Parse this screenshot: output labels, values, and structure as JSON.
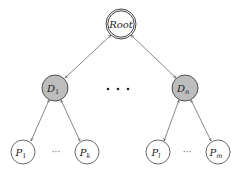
{
  "diagram": {
    "type": "tree",
    "colors": {
      "stroke": "#444444",
      "edge": "#555555",
      "domain_fill": "#bdbdbd",
      "leaf_fill": "#ffffff",
      "root_fill": "#ffffff"
    },
    "root": {
      "label": "Root"
    },
    "domains": [
      {
        "label": "D",
        "sub": "1"
      },
      {
        "label": "D",
        "sub": "n"
      }
    ],
    "leaves": [
      {
        "label": "P",
        "sub": "1"
      },
      {
        "label": "P",
        "sub": "k"
      },
      {
        "label": "P",
        "sub": "l"
      },
      {
        "label": "P",
        "sub": "m"
      }
    ],
    "ellipsis_middle": "• • •",
    "ellipsis_leaves": "···"
  }
}
